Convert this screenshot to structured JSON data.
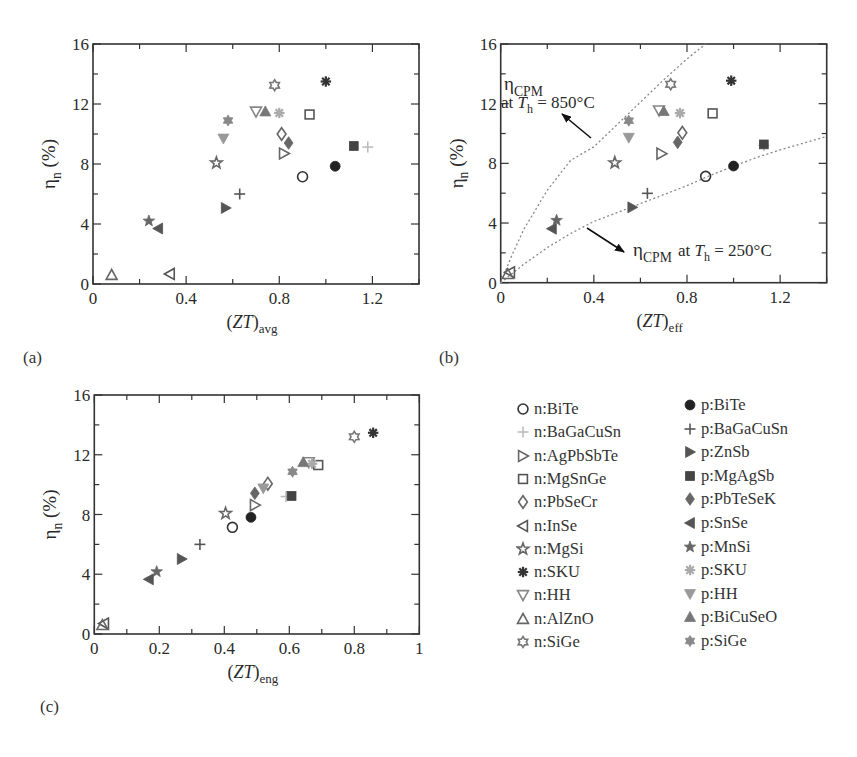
{
  "chart_data": [
    {
      "panel": "a",
      "type": "scatter",
      "panel_label": "(a)",
      "xlabel_main": "(ZT)",
      "xlabel_sub": "avg",
      "ylabel_main": "η",
      "ylabel_sub": "n",
      "ylabel_unit": " (%)",
      "xlim": [
        0,
        1.4
      ],
      "ylim": [
        0,
        16
      ],
      "xticks": [
        0,
        0.4,
        0.8,
        1.2
      ],
      "xtick_labels": [
        "0",
        "0.4",
        "0.8",
        "1.2"
      ],
      "xminor": 0.2,
      "yticks": [
        0,
        4,
        8,
        12,
        16
      ],
      "ytick_labels": [
        "0",
        "4",
        "8",
        "12",
        "16"
      ],
      "yminor": 2,
      "grid": false,
      "points": {
        "n:BiTe": [
          0.9,
          7.15
        ],
        "n:BaGaCuSn": [
          1.18,
          9.13
        ],
        "n:AgPbSbTe": [
          0.82,
          8.7
        ],
        "n:MgSnGe": [
          0.93,
          11.3
        ],
        "n:PbSeCr": [
          0.81,
          10.0
        ],
        "n:InSe": [
          0.33,
          0.67
        ],
        "n:MgSi": [
          0.53,
          8.07
        ],
        "n:SKU": [
          1.0,
          13.5
        ],
        "n:HH": [
          0.7,
          11.5
        ],
        "n:AlZnO": [
          0.08,
          0.6
        ],
        "n:SiGe": [
          0.78,
          13.25
        ],
        "p:BiTe": [
          1.04,
          7.85
        ],
        "p:BaGaCuSn": [
          0.63,
          6.0
        ],
        "p:ZnSb": [
          0.57,
          5.07
        ],
        "p:MgAgSb": [
          1.12,
          9.2
        ],
        "p:PbTeSeK": [
          0.84,
          9.4
        ],
        "p:SnSe": [
          0.28,
          3.7
        ],
        "p:MnSi": [
          0.24,
          4.2
        ],
        "p:SKU": [
          0.8,
          11.4
        ],
        "p:HH": [
          0.56,
          9.7
        ],
        "p:BiCuSeO": [
          0.74,
          11.5
        ],
        "p:SiGe": [
          0.58,
          10.9
        ]
      }
    },
    {
      "panel": "b",
      "type": "scatter",
      "panel_label": "(b)",
      "xlabel_main": "(ZT)",
      "xlabel_sub": "eff",
      "ylabel_main": "η",
      "ylabel_sub": "n",
      "ylabel_unit": " (%)",
      "xlim": [
        0,
        1.4
      ],
      "ylim": [
        0,
        16
      ],
      "xticks": [
        0,
        0.4,
        0.8,
        1.2
      ],
      "xtick_labels": [
        "0",
        "0.4",
        "0.8",
        "1.2"
      ],
      "xminor": 0.2,
      "yticks": [
        0,
        4,
        8,
        12,
        16
      ],
      "ytick_labels": [
        "0",
        "4",
        "8",
        "12",
        "16"
      ],
      "yminor": 2,
      "grid": false,
      "points": {
        "n:BiTe": [
          0.88,
          7.13
        ],
        "n:BaGaCuSn": [
          1.13,
          9.2
        ],
        "n:AgPbSbTe": [
          0.69,
          8.65
        ],
        "n:MgSnGe": [
          0.91,
          11.35
        ],
        "n:PbSeCr": [
          0.78,
          10.05
        ],
        "n:InSe": [
          0.04,
          0.7
        ],
        "n:MgSi": [
          0.49,
          8.04
        ],
        "n:SKU": [
          0.99,
          13.54
        ],
        "n:HH": [
          0.68,
          11.55
        ],
        "n:AlZnO": [
          0.03,
          0.58
        ],
        "n:SiGe": [
          0.73,
          13.3
        ],
        "p:BiTe": [
          1.0,
          7.82
        ],
        "p:BaGaCuSn": [
          0.63,
          5.99
        ],
        "p:ZnSb": [
          0.565,
          5.05
        ],
        "p:MgAgSb": [
          1.13,
          9.27
        ],
        "p:PbTeSeK": [
          0.76,
          9.41
        ],
        "p:SnSe": [
          0.22,
          3.62
        ],
        "p:MnSi": [
          0.24,
          4.18
        ],
        "p:SKU": [
          0.77,
          11.37
        ],
        "p:HH": [
          0.55,
          9.72
        ],
        "p:BiCuSeO": [
          0.7,
          11.5
        ],
        "p:SiGe": [
          0.55,
          10.86
        ]
      },
      "curves": [
        {
          "name": "eta_CPM at Th = 850°C",
          "style": "dotted",
          "x": [
            0,
            0.05,
            0.1,
            0.2,
            0.3,
            0.4,
            0.5,
            0.6,
            0.7,
            0.8,
            0.88
          ],
          "y": [
            0,
            1.9,
            3.6,
            6.2,
            8.2,
            9.1,
            10.6,
            12.1,
            13.6,
            15.0,
            16.0
          ]
        },
        {
          "name": "eta_CPM at Th = 250°C",
          "style": "dotted",
          "x": [
            0,
            0.1,
            0.2,
            0.3,
            0.4,
            0.5,
            0.6,
            0.7,
            0.8,
            0.9,
            1.0,
            1.1,
            1.2,
            1.3,
            1.4
          ],
          "y": [
            0,
            1.25,
            2.35,
            3.3,
            4.1,
            4.7,
            5.3,
            5.9,
            6.5,
            7.2,
            7.8,
            8.4,
            8.9,
            9.35,
            9.8
          ]
        }
      ],
      "annotations": [
        {
          "text_main": "η",
          "text_sub": "CPM",
          "line2_pre": "at ",
          "line2_var": "T",
          "line2_sub": "h",
          "line2_post": " = 850°C"
        },
        {
          "text_main": "η",
          "text_sub": "CPM",
          "line2_pre": " at ",
          "line2_var": "T",
          "line2_sub": "h",
          "line2_post": " = 250°C"
        }
      ]
    },
    {
      "panel": "c",
      "type": "scatter",
      "panel_label": "(c)",
      "xlabel_main": "(ZT)",
      "xlabel_sub": "eng",
      "ylabel_main": "η",
      "ylabel_sub": "n",
      "ylabel_unit": " (%)",
      "xlim": [
        0,
        1
      ],
      "ylim": [
        0,
        16
      ],
      "xticks": [
        0,
        0.2,
        0.4,
        0.6,
        0.8,
        1
      ],
      "xtick_labels": [
        "0",
        "0.2",
        "0.4",
        "0.6",
        "0.8",
        "1"
      ],
      "xminor": 0.1,
      "yticks": [
        0,
        4,
        8,
        12,
        16
      ],
      "ytick_labels": [
        "0",
        "4",
        "8",
        "12",
        "16"
      ],
      "yminor": 2,
      "grid": false,
      "points": {
        "n:BiTe": [
          0.425,
          7.14
        ],
        "n:BaGaCuSn": [
          0.59,
          9.2
        ],
        "n:AgPbSbTe": [
          0.494,
          8.63
        ],
        "n:MgSnGe": [
          0.689,
          11.31
        ],
        "n:PbSeCr": [
          0.534,
          10.06
        ],
        "n:InSe": [
          0.03,
          0.7
        ],
        "n:MgSi": [
          0.404,
          8.07
        ],
        "n:SKU": [
          0.858,
          13.47
        ],
        "n:HH": [
          0.66,
          11.5
        ],
        "n:AlZnO": [
          0.025,
          0.6
        ],
        "n:SiGe": [
          0.8,
          13.2
        ],
        "p:BiTe": [
          0.482,
          7.81
        ],
        "p:BaGaCuSn": [
          0.325,
          6.0
        ],
        "p:ZnSb": [
          0.269,
          5.02
        ],
        "p:MgAgSb": [
          0.607,
          9.24
        ],
        "p:PbTeSeK": [
          0.494,
          9.42
        ],
        "p:SnSe": [
          0.168,
          3.66
        ],
        "p:MnSi": [
          0.192,
          4.17
        ],
        "p:SKU": [
          0.67,
          11.4
        ],
        "p:HH": [
          0.52,
          9.75
        ],
        "p:BiCuSeO": [
          0.643,
          11.5
        ],
        "p:SiGe": [
          0.61,
          10.86
        ]
      }
    }
  ],
  "legend": {
    "n_series": [
      {
        "key": "n:BiTe",
        "label": "n:BiTe",
        "marker": "circle-open",
        "color": "#333333"
      },
      {
        "key": "n:BaGaCuSn",
        "label": "n:BaGaCuSn",
        "marker": "plus",
        "color": "#bdbdbd"
      },
      {
        "key": "n:AgPbSbTe",
        "label": "n:AgPbSbTe",
        "marker": "triangle-right-open",
        "color": "#666666"
      },
      {
        "key": "n:MgSnGe",
        "label": "n:MgSnGe",
        "marker": "square-open",
        "color": "#555555"
      },
      {
        "key": "n:PbSeCr",
        "label": "n:PbSeCr",
        "marker": "diamond-open",
        "color": "#666666"
      },
      {
        "key": "n:InSe",
        "label": "n:InSe",
        "marker": "triangle-left-open",
        "color": "#555555"
      },
      {
        "key": "n:MgSi",
        "label": "n:MgSi",
        "marker": "star-open",
        "color": "#666666"
      },
      {
        "key": "n:SKU",
        "label": "n:SKU",
        "marker": "asterisk",
        "color": "#333333"
      },
      {
        "key": "n:HH",
        "label": "n:HH",
        "marker": "triangle-down-open",
        "color": "#888888"
      },
      {
        "key": "n:AlZnO",
        "label": "n:AlZnO",
        "marker": "triangle-up-open",
        "color": "#666666"
      },
      {
        "key": "n:SiGe",
        "label": "n:SiGe",
        "marker": "hexagram-open",
        "color": "#777777"
      }
    ],
    "p_series": [
      {
        "key": "p:BiTe",
        "label": "p:BiTe",
        "marker": "circle-filled",
        "color": "#222222"
      },
      {
        "key": "p:BaGaCuSn",
        "label": "p:BaGaCuSn",
        "marker": "plus",
        "color": "#555555"
      },
      {
        "key": "p:ZnSb",
        "label": "p:ZnSb",
        "marker": "triangle-right-filled",
        "color": "#555555"
      },
      {
        "key": "p:MgAgSb",
        "label": "p:MgAgSb",
        "marker": "square-filled",
        "color": "#444444"
      },
      {
        "key": "p:PbTeSeK",
        "label": "p:PbTeSeK",
        "marker": "diamond-filled",
        "color": "#666666"
      },
      {
        "key": "p:SnSe",
        "label": "p:SnSe",
        "marker": "triangle-left-filled",
        "color": "#555555"
      },
      {
        "key": "p:MnSi",
        "label": "p:MnSi",
        "marker": "star-filled",
        "color": "#666666"
      },
      {
        "key": "p:SKU",
        "label": "p:SKU",
        "marker": "asterisk",
        "color": "#aaaaaa"
      },
      {
        "key": "p:HH",
        "label": "p:HH",
        "marker": "triangle-down-filled",
        "color": "#999999"
      },
      {
        "key": "p:BiCuSeO",
        "label": "p:BiCuSeO",
        "marker": "triangle-up-filled",
        "color": "#777777"
      },
      {
        "key": "p:SiGe",
        "label": "p:SiGe",
        "marker": "hexagram-filled",
        "color": "#888888"
      }
    ]
  }
}
